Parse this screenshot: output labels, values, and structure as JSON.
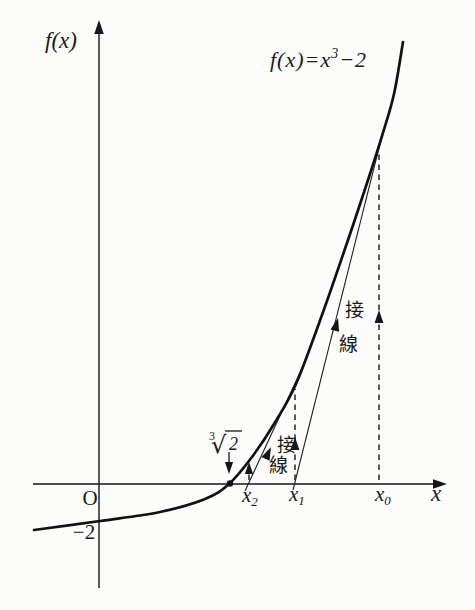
{
  "figure": {
    "title_equation": {
      "prefix": "f(x)=x",
      "sup": "3",
      "suffix": "−2"
    },
    "ink_color": "#161616",
    "background_color": "#fcfcfa"
  },
  "labels": {
    "fx": {
      "text": "f(x)",
      "at": [
        45,
        48
      ]
    },
    "equation": {
      "at": [
        270,
        67
      ],
      "prefix": "f(x)=x",
      "sup": "3",
      "suffix": "−2"
    },
    "origin": {
      "text": "O",
      "at": [
        90,
        505
      ]
    },
    "minus2": {
      "text": "−2",
      "at": [
        84,
        539
      ]
    },
    "cbrt": {
      "index": "3",
      "index_at": [
        209,
        440
      ],
      "radical": "√",
      "radical_at": [
        211,
        453
      ],
      "radicand": "2",
      "radicand_at": [
        229,
        450
      ]
    },
    "x2": {
      "base": "x",
      "sub": "2",
      "at": [
        242,
        502
      ]
    },
    "x1": {
      "base": "x",
      "sub": "1",
      "at": [
        289,
        501
      ]
    },
    "x0": {
      "base": "x",
      "sub": "0",
      "at": [
        375,
        501
      ]
    },
    "x_axis": {
      "text": "x",
      "at": [
        431,
        501
      ]
    },
    "tangent1": {
      "char1": "接",
      "char1_at": [
        354,
        317
      ],
      "char2": "線",
      "char2_at": [
        348,
        351
      ]
    },
    "tangent2": {
      "char1": "接",
      "char1_at": [
        286,
        452
      ],
      "char2": "線",
      "char2_at": [
        278,
        472
      ]
    }
  },
  "geometry": {
    "width": 475,
    "height": 610,
    "curve_points": [
      [
        34,
        530
      ],
      [
        100,
        521
      ],
      [
        160,
        512
      ],
      [
        205,
        499
      ],
      [
        229,
        484
      ],
      [
        252,
        457
      ],
      [
        274,
        424
      ],
      [
        296,
        384
      ],
      [
        322,
        315
      ],
      [
        348,
        240
      ],
      [
        368,
        180
      ],
      [
        382,
        136
      ],
      [
        394,
        94
      ],
      [
        403,
        42
      ]
    ],
    "lines": [
      {
        "name": "y-axis",
        "cls": "axis",
        "x1": 99,
        "y1": 588,
        "x2": 99,
        "y2": 24
      },
      {
        "name": "x-axis",
        "cls": "axis",
        "x1": 33,
        "y1": 484,
        "x2": 444,
        "y2": 484
      },
      {
        "name": "tangent-line-1",
        "cls": "tangent",
        "x1": 293,
        "y1": 490,
        "x2": 384,
        "y2": 128
      },
      {
        "name": "tangent-line-2",
        "cls": "tangent",
        "x1": 245,
        "y1": 491,
        "x2": 304,
        "y2": 364
      },
      {
        "name": "dashed-x0",
        "cls": "dashed",
        "x1": 379,
        "y1": 480,
        "x2": 379,
        "y2": 154
      },
      {
        "name": "dashed-x1",
        "cls": "dashed",
        "x1": 295,
        "y1": 480,
        "x2": 295,
        "y2": 389
      },
      {
        "name": "dashed-x2",
        "cls": "dashed",
        "x1": 249,
        "y1": 480,
        "x2": 249,
        "y2": 465
      },
      {
        "name": "root-pointer-line",
        "cls": "thin",
        "x1": 229,
        "y1": 452,
        "x2": 229,
        "y2": 468
      },
      {
        "name": "cbrt-vinculum",
        "cls": "thin",
        "x1": 225,
        "y1": 431,
        "x2": 242,
        "y2": 431
      }
    ],
    "arrows": [
      {
        "name": "y-axis-arrowhead",
        "at": [
          99,
          20
        ],
        "angle": -90,
        "size": 14
      },
      {
        "name": "x-axis-arrowhead",
        "at": [
          447,
          484
        ],
        "angle": 0,
        "size": 14
      },
      {
        "name": "dashed-x0-arrowhead",
        "at": [
          379,
          310
        ],
        "angle": -90,
        "size": 13
      },
      {
        "name": "dashed-x1-arrowhead",
        "at": [
          295,
          437
        ],
        "angle": -90,
        "size": 13
      },
      {
        "name": "dashed-x2-arrowhead",
        "at": [
          249,
          462
        ],
        "angle": -90,
        "size": 12
      },
      {
        "name": "root-pointer-arrowhead",
        "at": [
          229,
          474
        ],
        "angle": 90,
        "size": 12
      },
      {
        "name": "tangent1-arrowhead",
        "at": [
          338,
          318
        ],
        "angle": -75.8,
        "size": 13
      },
      {
        "name": "tangent2-arrowhead",
        "at": [
          271,
          447
        ],
        "angle": -65,
        "size": 13
      }
    ],
    "root_dot": {
      "cx": 230,
      "cy": 483.5,
      "r": 3.2
    }
  },
  "chart_data": {
    "type": "line",
    "function": "f(x) = x^3 - 2",
    "xlabel": "x",
    "ylabel": "f(x)",
    "y_tick_labels": [
      "-2"
    ],
    "x_point_labels": [
      "∛2",
      "x2",
      "x1",
      "x0"
    ],
    "points_px": {
      "origin": [
        99,
        484
      ],
      "root_cbrt2": [
        230,
        484
      ],
      "x2": [
        249,
        484
      ],
      "x1": [
        295,
        484
      ],
      "x0": [
        379,
        484
      ],
      "f_intercept_minus2": [
        99,
        521
      ],
      "tangency_at_x0": [
        379,
        152
      ],
      "tangency_at_x1": [
        295,
        389
      ]
    },
    "annotations": [
      "接線 (tangent line) ×2"
    ],
    "legend_position": "none",
    "grid": false
  }
}
